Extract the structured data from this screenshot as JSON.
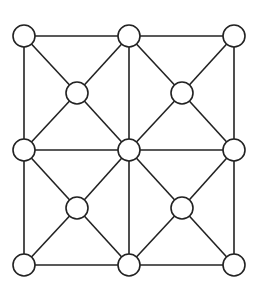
{
  "diagram": {
    "title": "",
    "nodes": [
      {
        "id": "n1",
        "x": 24,
        "y": 36
      },
      {
        "id": "n2",
        "x": 129,
        "y": 36
      },
      {
        "id": "n3",
        "x": 234,
        "y": 36
      },
      {
        "id": "n4",
        "x": 77,
        "y": 93
      },
      {
        "id": "n5",
        "x": 182,
        "y": 93
      },
      {
        "id": "n6",
        "x": 24,
        "y": 150
      },
      {
        "id": "n7",
        "x": 129,
        "y": 150
      },
      {
        "id": "n8",
        "x": 234,
        "y": 150
      },
      {
        "id": "n9",
        "x": 77,
        "y": 208
      },
      {
        "id": "n10",
        "x": 182,
        "y": 208
      },
      {
        "id": "n11",
        "x": 24,
        "y": 265
      },
      {
        "id": "n12",
        "x": 129,
        "y": 265
      },
      {
        "id": "n13",
        "x": 234,
        "y": 265
      }
    ],
    "edges": [
      [
        "n1",
        "n2"
      ],
      [
        "n2",
        "n3"
      ],
      [
        "n6",
        "n7"
      ],
      [
        "n7",
        "n8"
      ],
      [
        "n11",
        "n12"
      ],
      [
        "n12",
        "n13"
      ],
      [
        "n1",
        "n6"
      ],
      [
        "n6",
        "n11"
      ],
      [
        "n2",
        "n7"
      ],
      [
        "n7",
        "n12"
      ],
      [
        "n3",
        "n8"
      ],
      [
        "n8",
        "n13"
      ],
      [
        "n1",
        "n4"
      ],
      [
        "n4",
        "n7"
      ],
      [
        "n2",
        "n4"
      ],
      [
        "n4",
        "n6"
      ],
      [
        "n2",
        "n5"
      ],
      [
        "n5",
        "n8"
      ],
      [
        "n3",
        "n5"
      ],
      [
        "n5",
        "n7"
      ],
      [
        "n6",
        "n9"
      ],
      [
        "n9",
        "n12"
      ],
      [
        "n7",
        "n9"
      ],
      [
        "n9",
        "n11"
      ],
      [
        "n7",
        "n10"
      ],
      [
        "n10",
        "n13"
      ],
      [
        "n8",
        "n10"
      ],
      [
        "n10",
        "n12"
      ]
    ],
    "node_radius": 11,
    "stroke_color": "#222222",
    "fill_color": "#ffffff"
  }
}
